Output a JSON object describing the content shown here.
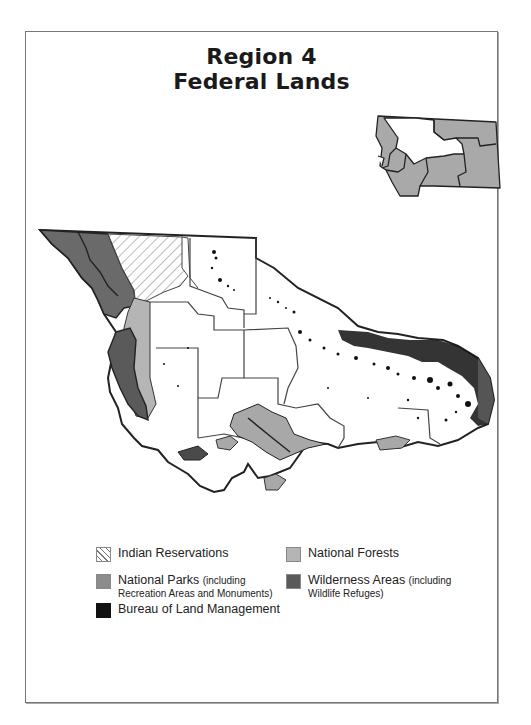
{
  "title": {
    "line1": "Region 4",
    "line2": "Federal Lands"
  },
  "inset_map": {
    "icon": "state-outline-locator-icon",
    "fill_color": "#a9a9a9",
    "highlight_color": "#ffffff"
  },
  "main_map": {
    "icon": "region-federal-lands-map",
    "colors": {
      "indian_reservations": "#ffffff",
      "national_forests": "#b5b5b5",
      "national_parks": "#8c8c8c",
      "wilderness_areas": "#5a5a5a",
      "bureau_of_land_management": "#111111",
      "boundary": "#222222"
    }
  },
  "legend": {
    "items": [
      {
        "id": "indian-reservations",
        "label": "Indian Reservations",
        "note": ""
      },
      {
        "id": "national-forests",
        "label": "National Forests",
        "note": ""
      },
      {
        "id": "national-parks",
        "label": "National Parks",
        "note_inline": "(including",
        "note": "Recreation Areas and Monuments)"
      },
      {
        "id": "wilderness-areas",
        "label": "Wilderness Areas",
        "note_inline": "(including",
        "note": "Wildlife Refuges)"
      },
      {
        "id": "blm",
        "label": "Bureau of Land Management",
        "note": ""
      }
    ]
  }
}
